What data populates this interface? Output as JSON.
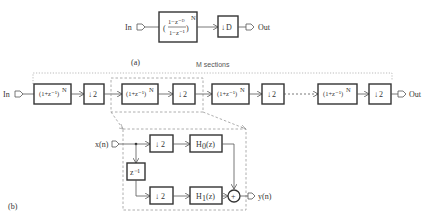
{
  "figure_a": {
    "label": "(a)",
    "input_label": "In",
    "output_label": "Out",
    "cic_filter": {
      "numerator": "1−z⁻ᴰ",
      "denominator": "1−z⁻¹",
      "exponent": "N"
    },
    "decimator": {
      "arrow": "↓",
      "factor": "D"
    }
  },
  "figure_b": {
    "label": "(b)",
    "sections_label": "M sections",
    "input_label": "In",
    "output_label": "Out",
    "stages": [
      {
        "filter": "(1+z⁻¹)",
        "exponent": "N",
        "decimator": "2"
      },
      {
        "filter": "(1+z⁻¹)",
        "exponent": "N",
        "decimator": "2"
      },
      {
        "filter": "(1+z⁻¹)",
        "exponent": "N",
        "decimator": "2"
      },
      {
        "filter": "(1+z⁻¹)",
        "exponent": "N",
        "decimator": "2"
      }
    ],
    "detail": {
      "input_label": "x(n)",
      "output_label": "y(n)",
      "delay": "z⁻¹",
      "top_decimator": "2",
      "bottom_decimator": "2",
      "h0": {
        "name": "H",
        "sub": "0",
        "arg": "(z)"
      },
      "h1": {
        "name": "H",
        "sub": "1",
        "arg": "(z)"
      },
      "adder_symbol": "+"
    }
  }
}
